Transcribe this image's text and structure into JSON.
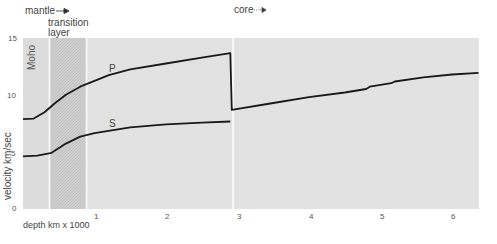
{
  "chart_data": {
    "type": "line",
    "title": "",
    "xlabel": "depth km x 1000",
    "ylabel": "velocity km/sec",
    "xlim": [
      0,
      6.37
    ],
    "ylim": [
      0,
      15
    ],
    "x_ticks": [
      "1",
      "2",
      "3",
      "4",
      "5",
      "6"
    ],
    "y_ticks": [
      "0",
      "5",
      "10",
      "15"
    ],
    "grid": false,
    "legend": "none (curves labeled inline)",
    "regions": [
      {
        "name": "Moho",
        "from": 0,
        "to": 0.35
      },
      {
        "name": "transition layer",
        "from": 0.37,
        "to": 0.87
      },
      {
        "name": "mantle",
        "from": 0,
        "to": 2.9
      },
      {
        "name": "core",
        "from": 2.9,
        "to": 6.37
      }
    ],
    "annotations": [
      "mantle →",
      "transition layer",
      "core →",
      "Moho"
    ],
    "series": [
      {
        "name": "P",
        "points": [
          [
            0,
            8.0
          ],
          [
            0.15,
            8.05
          ],
          [
            0.3,
            8.6
          ],
          [
            0.45,
            9.4
          ],
          [
            0.6,
            10.1
          ],
          [
            0.8,
            10.8
          ],
          [
            1.0,
            11.3
          ],
          [
            1.2,
            11.8
          ],
          [
            1.5,
            12.3
          ],
          [
            2.0,
            12.8
          ],
          [
            2.5,
            13.3
          ],
          [
            2.9,
            13.7
          ],
          [
            2.92,
            8.8
          ],
          [
            3.5,
            9.4
          ],
          [
            4.0,
            9.9
          ],
          [
            4.5,
            10.3
          ],
          [
            4.8,
            10.6
          ],
          [
            4.85,
            10.8
          ],
          [
            5.15,
            11.1
          ],
          [
            5.2,
            11.25
          ],
          [
            5.6,
            11.6
          ],
          [
            6.0,
            11.85
          ],
          [
            6.37,
            12.0
          ]
        ]
      },
      {
        "name": "S",
        "points": [
          [
            0,
            4.8
          ],
          [
            0.2,
            4.85
          ],
          [
            0.4,
            5.1
          ],
          [
            0.6,
            5.9
          ],
          [
            0.8,
            6.5
          ],
          [
            1.0,
            6.8
          ],
          [
            1.5,
            7.3
          ],
          [
            2.0,
            7.55
          ],
          [
            2.5,
            7.7
          ],
          [
            2.9,
            7.8
          ]
        ]
      }
    ]
  },
  "labels": {
    "mantle": "mantle",
    "transition": "transition",
    "layer": "layer",
    "core": "core",
    "moho": "Moho",
    "p": "P",
    "s": "S",
    "ylabel": "velocity km/sec",
    "xlabel": "depth  km x 1000",
    "y15": "15",
    "y10": "10",
    "y5": "5",
    "y0": "0",
    "x1": "1",
    "x2": "2",
    "x3": "3",
    "x4": "4",
    "x5": "5",
    "x6": "6"
  }
}
